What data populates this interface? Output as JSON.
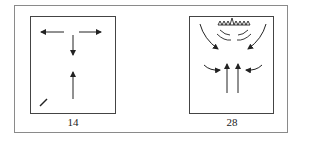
{
  "figure": {
    "panels": [
      {
        "id": "14",
        "label": "14",
        "description": "Airflow arrows: horizontal arrows pointing left and right at top, downward arrow in center, upward arrow below, small diagonal mark bottom-left"
      },
      {
        "id": "28",
        "label": "28",
        "description": "Heat source (zigzag) at top with curved emission arcs; curved arrows from top corners converge inward, curved arrows from sides point inward, two upward arrows in center"
      }
    ],
    "colors": {
      "stroke": "#222222",
      "frame": "#8a8a8a",
      "background": "#ffffff"
    }
  }
}
